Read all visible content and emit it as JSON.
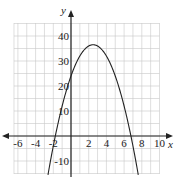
{
  "chart_data": {
    "type": "line",
    "title": "",
    "xlabel": "x",
    "ylabel": "y",
    "xlim": [
      -7,
      10.5
    ],
    "ylim": [
      -16,
      45
    ],
    "grid": true,
    "x_grid_step": 1,
    "y_grid_step": 5,
    "x_ticks": [
      -6,
      -4,
      -2,
      2,
      4,
      6,
      8,
      10
    ],
    "x_tick_labels": [
      "-6",
      "-4",
      "-2",
      "2",
      "4",
      "6",
      "8",
      "10"
    ],
    "y_ticks": [
      -10,
      10,
      20,
      30,
      40
    ],
    "y_tick_labels": [
      "-10",
      "10",
      "20",
      "30",
      "40"
    ],
    "series": [
      {
        "name": "parabola",
        "description": "downward-opening parabola, vertex near (2.5, 36.5), y-intercept near 24, x-intercepts near -1.8 and 6.8",
        "x": [
          -2.6,
          -2,
          -1,
          0,
          1,
          2,
          2.5,
          3,
          4,
          5,
          6,
          7,
          7.6
        ],
        "y": [
          -15.5,
          -4,
          12,
          24,
          32,
          36,
          36.5,
          36,
          32,
          24,
          12,
          -4,
          -15.5
        ]
      }
    ]
  }
}
